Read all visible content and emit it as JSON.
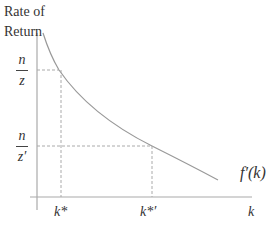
{
  "diagram": {
    "y_axis_label_line1": "Rate of",
    "y_axis_label_line2": "Return",
    "x_axis_label": "k",
    "curve_label": "f′(k)",
    "y_ticks": [
      {
        "numerator": "n",
        "denominator": "z"
      },
      {
        "numerator": "n",
        "denominator": "z′"
      }
    ],
    "x_ticks": [
      "k*",
      "k*′"
    ],
    "colors": {
      "axis": "#aaaaaa",
      "curve": "#999999",
      "dashed": "#aaaaaa",
      "text": "#333333"
    }
  }
}
